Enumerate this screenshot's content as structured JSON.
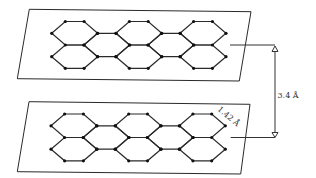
{
  "diagram": {
    "title": "",
    "sheets": [
      {
        "name": "upper-graphene-sheet",
        "outline": [
          [
            29.3,
            9.3
          ],
          [
            251,
            11.7
          ],
          [
            239.3,
            81
          ],
          [
            17.3,
            78.7
          ]
        ],
        "offset": [
          0,
          0
        ]
      },
      {
        "name": "lower-graphene-sheet",
        "outline": [
          [
            29,
            101.7
          ],
          [
            250,
            104.3
          ],
          [
            240.7,
            174
          ],
          [
            17.3,
            171.7
          ]
        ],
        "offset": [
          -0.7,
          92.5
        ]
      }
    ],
    "lattice": {
      "hex_centers_outer_x": [
        74.7,
        138.8,
        203.0
      ],
      "hex_centers_inner_x": [
        106.8,
        170.9
      ],
      "half_width_outer": 23,
      "half_width_inner": 9.4,
      "row_a_y": [
        21.5,
        33.3,
        45
      ],
      "row_b_y": [
        45,
        56.7,
        68.3
      ],
      "inner_y": [
        33.3,
        45,
        56.7
      ],
      "atom_radius": 1.6
    },
    "interlayer_spacing": {
      "label": "3.4 Å",
      "x": 275,
      "top_y": 45,
      "bottom_y": 137.5,
      "top_leader_from_x": 230,
      "bottom_leader_from_x": 230.7,
      "label_x": 277.5,
      "label_y": 98
    },
    "bond_length": {
      "label": "1.42 Å",
      "x": 217,
      "y": 110,
      "rotation_deg": 40
    }
  }
}
